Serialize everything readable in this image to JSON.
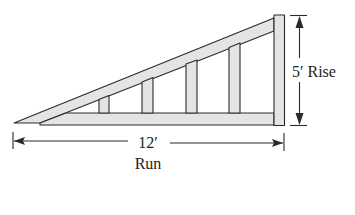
{
  "diagram": {
    "type": "roof-truss",
    "colors": {
      "stroke": "#2a2a2a",
      "wood_fill": "#e4e4e4",
      "background": "#ffffff"
    },
    "rise": {
      "value": "5′",
      "label": "Rise",
      "text": "5′ Rise"
    },
    "run": {
      "value": "12′",
      "label": "Run"
    },
    "vertical_members": 4
  }
}
